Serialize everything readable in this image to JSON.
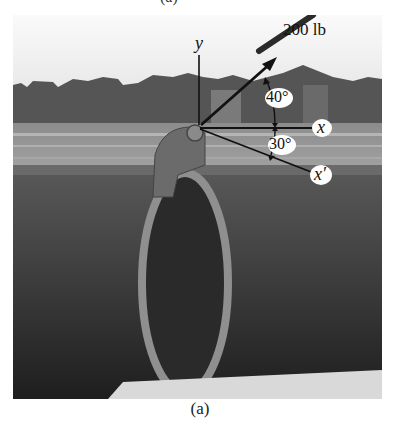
{
  "figure": {
    "caption": "(a)",
    "top_cut_text": "(a)"
  },
  "diagram": {
    "axes": {
      "y_label": "y",
      "x_label": "x",
      "x_prime_label": "x′"
    },
    "force": {
      "label": "200 lb",
      "magnitude": 200,
      "unit": "lb"
    },
    "angles": [
      {
        "label": "40°",
        "value": 40,
        "between": "force and x"
      },
      {
        "label": "30°",
        "value": 30,
        "between": "x and x′"
      }
    ]
  },
  "colors": {
    "sky": "#f2f2f2",
    "ground": "#8a8a8a",
    "pipe": "#3a3a3a",
    "lines": "#111111",
    "label_bubble": "#ffffff"
  }
}
